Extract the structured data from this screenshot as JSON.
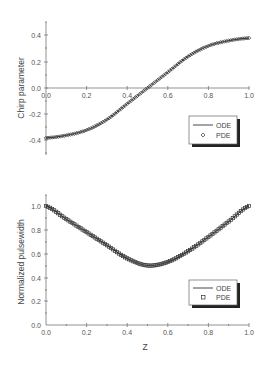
{
  "chart_data": [
    {
      "type": "line",
      "title": "",
      "xlabel": "",
      "ylabel": "Chirp parameter",
      "xlim": [
        0.0,
        1.0
      ],
      "ylim": [
        -0.5,
        0.5
      ],
      "xticks": [
        "0.0",
        "0.2",
        "0.4",
        "0.6",
        "0.8",
        "1.0"
      ],
      "yticks": [
        "-0.4",
        "-0.2",
        "0.0",
        "0.2",
        "0.4"
      ],
      "grid": false,
      "legend_position": "right-below-axis",
      "series": [
        {
          "name": "ODE",
          "style": "line",
          "x": [
            0.0,
            0.1,
            0.2,
            0.3,
            0.4,
            0.5,
            0.6,
            0.7,
            0.8,
            0.9,
            1.0
          ],
          "values": [
            -0.38,
            -0.36,
            -0.32,
            -0.24,
            -0.12,
            0.0,
            0.12,
            0.24,
            0.32,
            0.36,
            0.38
          ]
        },
        {
          "name": "PDE",
          "style": "diamond-markers",
          "x": [
            0.0,
            0.1,
            0.2,
            0.3,
            0.4,
            0.5,
            0.6,
            0.7,
            0.8,
            0.9,
            1.0
          ],
          "values": [
            -0.38,
            -0.36,
            -0.32,
            -0.24,
            -0.12,
            0.0,
            0.12,
            0.24,
            0.32,
            0.36,
            0.38
          ]
        }
      ]
    },
    {
      "type": "line",
      "title": "",
      "xlabel": "Z",
      "ylabel": "Normalized pulsewidth",
      "xlim": [
        0.0,
        1.0
      ],
      "ylim": [
        0.0,
        1.1
      ],
      "xticks": [
        "0.0",
        "0.2",
        "0.4",
        "0.6",
        "0.8",
        "1.0"
      ],
      "yticks": [
        "0.0",
        "0.2",
        "0.4",
        "0.6",
        "0.8",
        "1.0"
      ],
      "grid": false,
      "legend_position": "lower-right",
      "series": [
        {
          "name": "ODE",
          "style": "line",
          "x": [
            0.0,
            0.1,
            0.2,
            0.3,
            0.4,
            0.5,
            0.6,
            0.7,
            0.8,
            0.9,
            1.0
          ],
          "values": [
            1.0,
            0.89,
            0.78,
            0.67,
            0.56,
            0.5,
            0.53,
            0.62,
            0.74,
            0.87,
            1.0
          ]
        },
        {
          "name": "PDE",
          "style": "square-markers",
          "x": [
            0.0,
            0.1,
            0.2,
            0.3,
            0.4,
            0.5,
            0.6,
            0.7,
            0.8,
            0.9,
            1.0
          ],
          "values": [
            1.0,
            0.89,
            0.78,
            0.67,
            0.56,
            0.5,
            0.53,
            0.62,
            0.74,
            0.87,
            1.0
          ]
        }
      ]
    }
  ],
  "top": {
    "ylabel": "Chirp parameter",
    "yticks": [
      "0.4",
      "0.2",
      "0.0",
      "-0.2",
      "-0.4"
    ],
    "xticks": [
      "0.0",
      "0.2",
      "0.4",
      "0.6",
      "0.8",
      "1.0"
    ],
    "legend": {
      "ode": "ODE",
      "pde": "PDE"
    }
  },
  "bottom": {
    "ylabel": "Normalized pulsewidth",
    "xlabel": "Z",
    "yticks": [
      "1.0",
      "0.8",
      "0.6",
      "0.4",
      "0.2",
      "0.0"
    ],
    "xticks": [
      "0.0",
      "0.2",
      "0.4",
      "0.6",
      "0.8",
      "1.0"
    ],
    "legend": {
      "ode": "ODE",
      "pde": "PDE"
    }
  }
}
